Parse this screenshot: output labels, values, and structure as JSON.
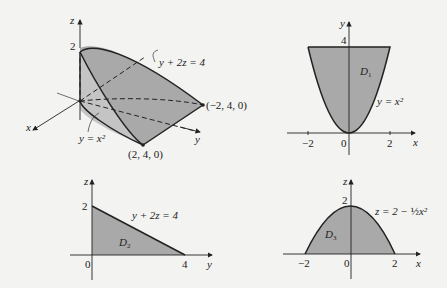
{
  "figure": {
    "solid_3d": {
      "axes": {
        "x": "x",
        "y": "y",
        "z": "z"
      },
      "z_tick": "2",
      "surface_labels": {
        "plane": "y + 2z = 4",
        "cylinder": "y = x²"
      },
      "points": {
        "left": "(−2, 4, 0)",
        "right": "(2, 4, 0)"
      }
    },
    "projection_D1": {
      "axes": {
        "horizontal": "x",
        "vertical": "y"
      },
      "ticks_x": [
        "−2",
        "0",
        "2"
      ],
      "tick_y": "4",
      "region_label": "D",
      "region_sub": "1",
      "curve_label": "y = x²"
    },
    "projection_D2": {
      "axes": {
        "horizontal": "y",
        "vertical": "z"
      },
      "ticks_h": [
        "0",
        "4"
      ],
      "tick_v": "2",
      "region_label": "D",
      "region_sub": "2",
      "curve_label": "y + 2z = 4"
    },
    "projection_D3": {
      "axes": {
        "horizontal": "x",
        "vertical": "z"
      },
      "ticks_h": [
        "−2",
        "0",
        "2"
      ],
      "tick_v": "2",
      "region_label": "D",
      "region_sub": "3",
      "curve_label_main": "z = 2 − ",
      "curve_label_frac": "½",
      "curve_label_tail": "x²"
    },
    "colors": {
      "fill": "#a9a9a9",
      "background": "#f3f3f1",
      "ink": "#222222"
    }
  }
}
